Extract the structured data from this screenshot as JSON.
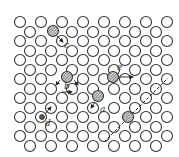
{
  "figure": {
    "labels": {
      "a": "a",
      "b": "b",
      "c": "c",
      "d": "d",
      "e": "e"
    },
    "colors": {
      "stroke": "#333333",
      "background": "#ffffff"
    },
    "lattice": {
      "rows_a_y": [
        22,
        41,
        60,
        79,
        98,
        117,
        136
      ],
      "rows_b_y": [
        32,
        51,
        70,
        89,
        108,
        127,
        146
      ],
      "x_start_a": 20,
      "x_start_b": 30,
      "x_step": 21,
      "radius": 5.5
    }
  }
}
